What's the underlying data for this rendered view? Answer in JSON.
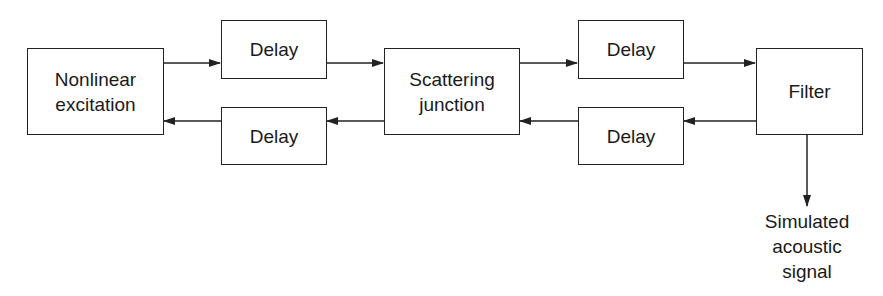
{
  "diagram": {
    "type": "block-diagram",
    "blocks": {
      "excitation": {
        "label_line1": "Nonlinear",
        "label_line2": "excitation"
      },
      "delay_top_left": {
        "label": "Delay"
      },
      "delay_bottom_left": {
        "label": "Delay"
      },
      "scattering": {
        "label_line1": "Scattering",
        "label_line2": "junction"
      },
      "delay_top_right": {
        "label": "Delay"
      },
      "delay_bottom_right": {
        "label": "Delay"
      },
      "filter": {
        "label": "Filter"
      }
    },
    "output": {
      "line1": "Simulated",
      "line2": "acoustic",
      "line3": "signal"
    },
    "connections": [
      {
        "from": "Nonlinear excitation",
        "to": "Delay (top left)"
      },
      {
        "from": "Delay (top left)",
        "to": "Scattering junction"
      },
      {
        "from": "Scattering junction",
        "to": "Delay (top right)"
      },
      {
        "from": "Delay (top right)",
        "to": "Filter"
      },
      {
        "from": "Filter",
        "to": "Delay (bottom right)"
      },
      {
        "from": "Delay (bottom right)",
        "to": "Scattering junction"
      },
      {
        "from": "Scattering junction",
        "to": "Delay (bottom left)"
      },
      {
        "from": "Delay (bottom left)",
        "to": "Nonlinear excitation"
      },
      {
        "from": "Filter",
        "to": "Simulated acoustic signal"
      }
    ]
  }
}
